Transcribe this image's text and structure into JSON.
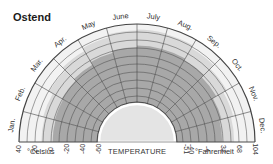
{
  "title": "Ostend",
  "center_label": "TEMPERATURE",
  "units": {
    "celsius": "°Celsius",
    "fahrenheit": "°Fahrenheit"
  },
  "colors": {
    "outer_band": "#f2f2f2",
    "mid_band": "#d9d9d9",
    "core_band": "#a8a8a8",
    "hub": "#e4e4e4",
    "grid": "#444444"
  },
  "chart_data": {
    "type": "radial",
    "title": "Ostend",
    "subtitle": "Temperature by month",
    "months": [
      "Jan.",
      "Feb.",
      "Mar.",
      "Apr.",
      "May",
      "June",
      "July",
      "Aug.",
      "Sep.",
      "Oct.",
      "Nov.",
      "Dec."
    ],
    "celsius_ticks": [
      40,
      20,
      0,
      -20,
      -40,
      -60
    ],
    "fahrenheit_ticks": [
      -51,
      -40,
      -4,
      32,
      68,
      104
    ],
    "radial_axis": {
      "label": "TEMPERATURE",
      "range_c": [
        -60,
        40
      ],
      "range_f": [
        -51,
        104
      ]
    },
    "series": [
      {
        "name": "Absolute range",
        "values_c_max": [
          12,
          14,
          19,
          24,
          28,
          32,
          33,
          32,
          28,
          22,
          17,
          14
        ],
        "values_c_min": [
          -14,
          -13,
          -9,
          -4,
          0,
          4,
          7,
          6,
          3,
          -3,
          -7,
          -12
        ]
      },
      {
        "name": "Mean range",
        "values_c_max": [
          6,
          7,
          9,
          12,
          16,
          19,
          21,
          21,
          19,
          15,
          10,
          7
        ],
        "values_c_min": [
          1,
          1,
          3,
          5,
          8,
          11,
          13,
          13,
          11,
          8,
          4,
          2
        ]
      }
    ],
    "grid": true
  }
}
